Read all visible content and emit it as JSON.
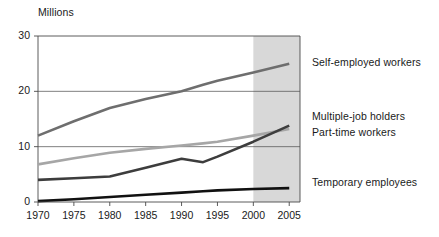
{
  "chart_data": {
    "type": "line",
    "title": "",
    "subtitle": "",
    "xlabel": "",
    "ylabel": "Millions",
    "x": [
      1970,
      1975,
      1980,
      1985,
      1990,
      1993,
      1995,
      2000,
      2005
    ],
    "xlim": [
      1970,
      2006.5
    ],
    "ylim": [
      0,
      30
    ],
    "yticks": [
      0,
      10,
      20,
      30
    ],
    "ytick_labels": [
      "0",
      "10",
      "20",
      "30"
    ],
    "xticks": [
      1970,
      1975,
      1980,
      1985,
      1990,
      1995,
      2000,
      2005
    ],
    "xtick_labels": [
      "1970",
      "1975",
      "1980",
      "1985",
      "1990",
      "1995",
      "2000",
      "2005"
    ],
    "grid": "horizontal-at-10-and-20",
    "legend_position": "right-inline-labels",
    "shaded_region": {
      "label": "projected",
      "from": 2000,
      "to": 2006.5,
      "color": "#d8d8d8"
    },
    "series": [
      {
        "name": "Self-employed workers",
        "color": "#6e6e6e",
        "width": 2.6,
        "values": [
          12.0,
          14.6,
          17.0,
          18.6,
          20.0,
          21.2,
          21.9,
          23.4,
          25.0
        ]
      },
      {
        "name": "Part-time workers",
        "color": "#a6a6a6",
        "width": 2.6,
        "values": [
          6.8,
          7.9,
          8.9,
          9.6,
          10.2,
          10.6,
          10.9,
          12.0,
          13.2
        ]
      },
      {
        "name": "Multiple-job holders",
        "color": "#3d3d3d",
        "width": 2.6,
        "values": [
          4.0,
          4.3,
          4.6,
          6.2,
          7.8,
          7.2,
          8.2,
          10.9,
          13.8
        ]
      },
      {
        "name": "Temporary employees",
        "color": "#111111",
        "width": 2.6,
        "values": [
          0.15,
          0.5,
          0.9,
          1.3,
          1.7,
          1.95,
          2.1,
          2.35,
          2.5
        ]
      }
    ],
    "annotations": [
      {
        "text": "Self-employed workers",
        "at_value": 25.0
      },
      {
        "text": "Multiple-job holders",
        "at_value": 13.8
      },
      {
        "text": "Part-time workers",
        "at_value": 13.2
      },
      {
        "text": "Temporary employees",
        "at_value": 2.5
      }
    ]
  },
  "labels": {
    "y_axis_title": "Millions",
    "self_employed": "Self-employed workers",
    "multiple_job": "Multiple-job holders",
    "part_time": "Part-time workers",
    "temporary": "Temporary employees"
  }
}
